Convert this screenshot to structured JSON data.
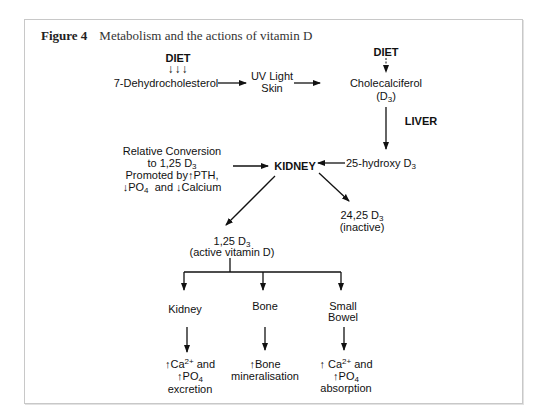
{
  "figure": {
    "number_label": "Figure 4",
    "title": "Metabolism and the actions of vitamin D"
  },
  "nodes": {
    "diet_left": "DIET",
    "diet_left_arrows": "↓↓↓",
    "dehydro": "7-Dehydrocholesterol",
    "uv_line1": "UV Light",
    "uv_line2": "Skin",
    "diet_right": "DIET",
    "chole_line1": "Cholecalciferol",
    "chole_line2_pre": "(D",
    "chole_line2_sub": "3",
    "chole_line2_post": ")",
    "liver": "LIVER",
    "hydroxy_pre": "25-hydroxy D",
    "hydroxy_sub": "3",
    "kidney_center": "KIDNEY",
    "rel_line1": "Relative Conversion",
    "rel_line2_pre": "to 1,25 D",
    "rel_line2_sub": "3",
    "rel_line3_pre": "Promoted by",
    "rel_line3_arrow": "↑",
    "rel_line3_post": "PTH,",
    "rel_line4_arrow1": "↓",
    "rel_line4_po": "PO",
    "rel_line4_sub": "4",
    "rel_line4_and": "and",
    "rel_line4_arrow2": "↓",
    "rel_line4_ca": "Calcium",
    "inactive_line1_pre": "24,25 D",
    "inactive_line1_sub": "3",
    "inactive_line2": "(inactive)",
    "active_line1_pre": "1,25 D",
    "active_line1_sub": "3",
    "active_line2": "(active vitamin D)",
    "target_kidney": "Kidney",
    "target_bone": "Bone",
    "target_bowel_line1": "Small",
    "target_bowel_line2": "Bowel"
  },
  "effects": {
    "up_arrow": "↑",
    "kidney": {
      "ca": "Ca",
      "ca_sup": "2+",
      "and": "and",
      "po": "PO",
      "po_sub": "4",
      "tail": "excretion"
    },
    "bone": {
      "line1": "Bone",
      "line2": "mineralisation"
    },
    "bowel": {
      "ca": "Ca",
      "ca_sup": "2+",
      "and": "and",
      "po": "PO",
      "po_sub": "4",
      "tail": "absorption"
    }
  }
}
